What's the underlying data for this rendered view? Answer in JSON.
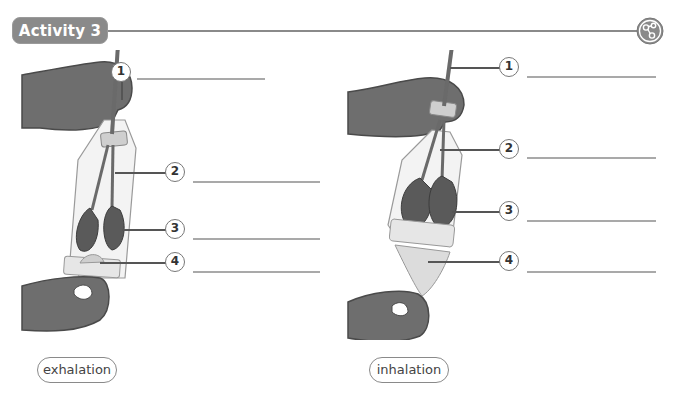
{
  "header": {
    "activity_label": "Activity 3",
    "icon": "network-nodes-icon"
  },
  "colors": {
    "badge": "#8a8a8a",
    "rule": "#8a8a8a",
    "hand": "#6e6e6e",
    "lung": "#5a5a5a",
    "bottle": "#e8e8e8",
    "answer_line": "#a9a9a9"
  },
  "figures": [
    {
      "caption": "exhalation",
      "callouts": [
        {
          "number": "1",
          "answer": ""
        },
        {
          "number": "2",
          "answer": ""
        },
        {
          "number": "3",
          "answer": ""
        },
        {
          "number": "4",
          "answer": ""
        }
      ]
    },
    {
      "caption": "inhalation",
      "callouts": [
        {
          "number": "1",
          "answer": ""
        },
        {
          "number": "2",
          "answer": ""
        },
        {
          "number": "3",
          "answer": ""
        },
        {
          "number": "4",
          "answer": ""
        }
      ]
    }
  ]
}
